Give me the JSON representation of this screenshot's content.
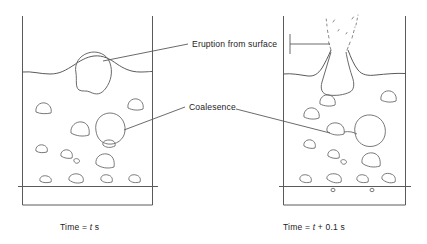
{
  "figure": {
    "background_color": "#ffffff",
    "line_color": "#4a4a4a",
    "text_color": "#1c1c1c"
  },
  "annotations": [
    {
      "id": "eruption",
      "label": "Eruption from surface",
      "leader_to_left_panel": true,
      "leader_to_right_panel": true
    },
    {
      "id": "coalescence",
      "label": "Coalesence",
      "leader_to_left_panel": true,
      "leader_to_right_panel": true
    }
  ],
  "panels": [
    {
      "id": "left-panel",
      "caption_prefix": "Time = ",
      "caption_variable": "t",
      "caption_suffix": " s",
      "caption_full": "Time = t s",
      "description": "Fluidised bed at time t: a large bubble approaches the bed surface and two bubbles are about to coalesce.",
      "vessel": {
        "left_wall_x": 22,
        "right_wall_x": 152,
        "top_y": 16,
        "bottom_y": 205,
        "distributor_y": 186
      },
      "bed_surface": "wavy line with a bulge raised by the rising bubble",
      "bubble_count": 15
    },
    {
      "id": "right-panel",
      "caption_prefix": "Time = ",
      "caption_variable": "t",
      "caption_suffix": " + 0.1 s",
      "caption_full": "Time = t + 0.1 s",
      "description": "Fluidised bed 0.1 s later: the bubble has burst through the surface throwing a spray of particles upward, and the two bubbles have merged.",
      "vessel": {
        "left_wall_x": 283,
        "right_wall_x": 405,
        "top_y": 16,
        "bottom_y": 205,
        "distributor_y": 186
      },
      "bed_surface": "wavy line broken by an erupting jet / crater",
      "bubble_count": 14,
      "eruption": {
        "type": "particle-spray-jet",
        "style": "broken dashed streaks"
      }
    }
  ]
}
